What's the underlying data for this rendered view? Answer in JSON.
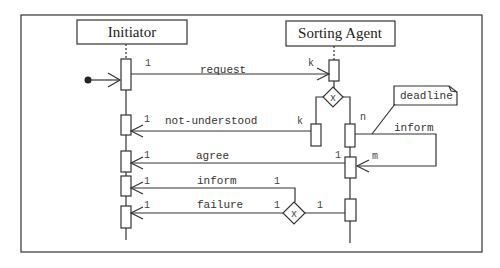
{
  "diagram": {
    "type": "AUML protocol / sequence diagram",
    "roles": [
      {
        "id": "initiator",
        "label": "Initiator"
      },
      {
        "id": "sorting_agent",
        "label": "Sorting Agent"
      }
    ],
    "note": {
      "label": "deadline"
    },
    "messages": [
      {
        "id": "request",
        "label": "request",
        "from": "Initiator",
        "to": "Sorting Agent",
        "from_mult": "1",
        "to_mult": "k"
      },
      {
        "id": "not_understood",
        "label": "not-understood",
        "from": "Sorting Agent",
        "to": "Initiator",
        "from_mult": "k",
        "to_mult": "1"
      },
      {
        "id": "inform_self",
        "label": "inform",
        "from": "Sorting Agent",
        "to": "Sorting Agent",
        "from_mult": "n",
        "to_mult": "m"
      },
      {
        "id": "agree",
        "label": "agree",
        "from": "Sorting Agent",
        "to": "Initiator",
        "from_mult": "1",
        "to_mult": "1"
      },
      {
        "id": "inform",
        "label": "inform",
        "from": "Sorting Agent",
        "to": "Initiator",
        "from_mult": "1",
        "to_mult": "1"
      },
      {
        "id": "failure",
        "label": "failure",
        "from": "Sorting Agent",
        "to": "Initiator",
        "from_mult": "1",
        "to_mult": "1"
      }
    ],
    "decisions": [
      {
        "id": "xor_top",
        "label": "x"
      },
      {
        "id": "xor_bottom",
        "label": "x",
        "mult_in": "1",
        "mult_out": "1"
      }
    ],
    "multiplicities": {
      "request_src": "1",
      "request_dst": "k",
      "nu_src": "k",
      "nu_dst": "1",
      "inform_self_src": "n",
      "inform_self_dst": "m",
      "agree_src": "1",
      "agree_dst": "1",
      "inform_src": "1",
      "inform_dst": "1",
      "failure_dst": "1",
      "xor_in": "1",
      "xor_out": "1"
    }
  }
}
